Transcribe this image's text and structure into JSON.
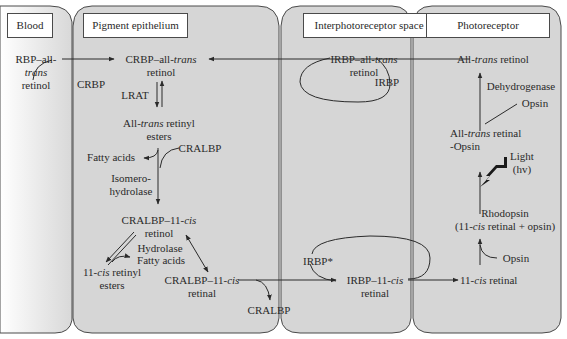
{
  "panels": {
    "blood": {
      "title": "Blood"
    },
    "pigment": {
      "title": "Pigment epithelium"
    },
    "interphoto": {
      "title": "Interphotoreceptor space"
    },
    "photo": {
      "title": "Photoreceptor"
    }
  },
  "labels": {
    "rbp_a": "RBP–all-",
    "rbp_b": "trans",
    "rbp_c": "retinol",
    "crbp_complex_a": "CRBP–all-",
    "crbp_complex_b": "trans",
    "crbp_complex_c": "retinol",
    "crbp": "CRBP",
    "lrat": "LRAT",
    "esters_a": "All-",
    "esters_b": "trans",
    "esters_c": " retinyl",
    "esters_d": "esters",
    "fatty_acids_1": "Fatty acids",
    "cralbp_1": "CRALBP",
    "isomero_a": "Isomero-",
    "isomero_b": "hydrolase",
    "cralbp_retinol_a": "CRALBP–11-",
    "cralbp_retinol_b": "cis",
    "cralbp_retinol_c": "retinol",
    "hydrolase": "Hydrolase",
    "fatty_acids_2": "Fatty acids",
    "cis_esters_a": "11-",
    "cis_esters_b": "cis",
    "cis_esters_c": " retinyl",
    "cis_esters_d": "esters",
    "cralbp_retinal_a": "CRALBP–11-",
    "cralbp_retinal_b": "cis",
    "cralbp_retinal_c": "retinal",
    "cralbp_2": "CRALBP",
    "irbp_trans_a": "IRBP–all-",
    "irbp_trans_b": "trans",
    "irbp_trans_c": "retinol",
    "irbp": "IRBP",
    "irbp_star": "IRBP*",
    "irbp_cis_a": "IRBP–11-",
    "irbp_cis_b": "cis",
    "irbp_cis_c": "retinal",
    "photo_retinol_a": "All-",
    "photo_retinol_b": "trans",
    "photo_retinol_c": " retinol",
    "dehydrogenase": "Dehydrogenase",
    "opsin_1": "Opsin",
    "trans_retinal_a": "All-",
    "trans_retinal_b": "trans",
    "trans_retinal_c": " retinal",
    "trans_retinal_d": "-Opsin",
    "light_a": "Light",
    "light_b": "(hv)",
    "rhodopsin_a": "Rhodopsin",
    "rhodopsin_b": "(11-",
    "rhodopsin_c": "cis",
    "rhodopsin_d": " retinal + opsin)",
    "opsin_2": "Opsin",
    "cis_retinal_a": "11-",
    "cis_retinal_b": "cis",
    "cis_retinal_c": " retinal"
  },
  "colors": {
    "panel_fill": "#d6d6d6",
    "border": "#4a4a4a",
    "text": "#2a2a2a"
  }
}
